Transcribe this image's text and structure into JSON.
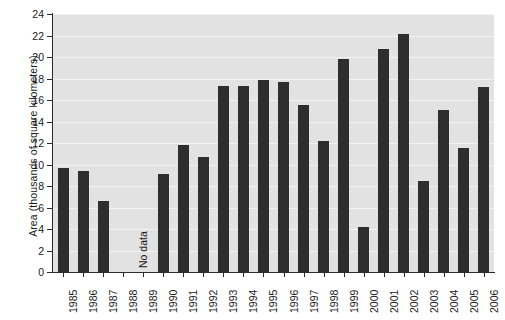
{
  "chart_data": {
    "type": "bar",
    "title": "",
    "xlabel": "",
    "ylabel": "Area (thousands of square kilometers)",
    "ylim": [
      0,
      24
    ],
    "ytick_step": 2,
    "yticks": [
      0,
      2,
      4,
      6,
      8,
      10,
      12,
      14,
      16,
      18,
      20,
      22,
      24
    ],
    "grid": true,
    "grid_axis": "y",
    "legend": null,
    "plot_background": "#e2e2e2",
    "bar_color": "#2e2e2e",
    "categories": [
      "1985",
      "1986",
      "1987",
      "1988",
      "1989",
      "1990",
      "1991",
      "1992",
      "1993",
      "1994",
      "1995",
      "1996",
      "1997",
      "1998",
      "1999",
      "2000",
      "2001",
      "2002",
      "2003",
      "2004",
      "2005",
      "2006"
    ],
    "values": [
      9.7,
      9.4,
      6.6,
      null,
      null,
      9.1,
      11.8,
      10.7,
      17.3,
      17.3,
      17.9,
      17.7,
      15.5,
      12.2,
      19.8,
      4.2,
      20.7,
      22.1,
      8.5,
      15.1,
      11.5,
      17.2
    ],
    "annotations": [
      {
        "text": "No data",
        "categories": [
          "1988",
          "1989"
        ],
        "rotation": 90
      }
    ]
  },
  "axis": {
    "y_title": "Area (thousands of square kilometers)",
    "tick_labels_y": [
      "0",
      "2",
      "4",
      "6",
      "8",
      "10",
      "12",
      "14",
      "16",
      "18",
      "20",
      "22",
      "24"
    ],
    "tick_labels_x": [
      "1985",
      "1986",
      "1987",
      "1988",
      "1989",
      "1990",
      "1991",
      "1992",
      "1993",
      "1994",
      "1995",
      "1996",
      "1997",
      "1998",
      "1999",
      "2000",
      "2001",
      "2002",
      "2003",
      "2004",
      "2005",
      "2006"
    ]
  },
  "annotation": {
    "no_data_label": "No data"
  }
}
